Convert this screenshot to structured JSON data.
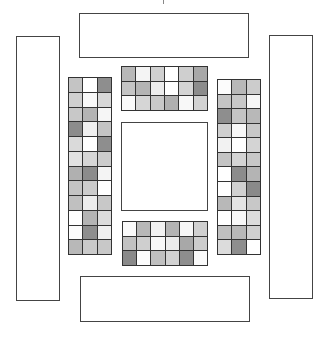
{
  "diagram": {
    "outer_boxes": [
      {
        "id": "top-box",
        "x": 79,
        "y": 13,
        "w": 170,
        "h": 45
      },
      {
        "id": "bottom-box",
        "x": 80,
        "y": 276,
        "w": 170,
        "h": 46
      },
      {
        "id": "left-box",
        "x": 16,
        "y": 36,
        "w": 44,
        "h": 265
      },
      {
        "id": "right-box",
        "x": 269,
        "y": 35,
        "w": 44,
        "h": 264
      }
    ],
    "center_box": {
      "id": "center-box",
      "x": 121,
      "y": 122,
      "w": 87,
      "h": 89
    },
    "grids": [
      {
        "id": "top-grid",
        "x": 121,
        "y": 66,
        "w": 87,
        "h": 45,
        "cols": 6,
        "rows": 3,
        "shades": [
          [
            "#b8b8b8",
            "#f4f4f4",
            "#d0d0d0",
            "#ffffff",
            "#cfcfcf",
            "#a8a8a8"
          ],
          [
            "#c4c4c4",
            "#b4b4b4",
            "#ececec",
            "#ffffff",
            "#d4d4d4",
            "#8c8c8c"
          ],
          [
            "#fafafa",
            "#d6d6d6",
            "#c8c8c8",
            "#b0b0b0",
            "#f8f8f8",
            "#d2d2d2"
          ]
        ]
      },
      {
        "id": "bottom-grid",
        "x": 122,
        "y": 221,
        "w": 86,
        "h": 45,
        "cols": 6,
        "rows": 3,
        "shades": [
          [
            "#fafafa",
            "#b8b8b8",
            "#f2f2f2",
            "#b4b4b4",
            "#f6f6f6",
            "#d0d0d0"
          ],
          [
            "#c2c2c2",
            "#cfcfcf",
            "#f8f8f8",
            "#ececec",
            "#a8a8a8",
            "#cccccc"
          ],
          [
            "#8a8a8a",
            "#fcfcfc",
            "#c0c0c0",
            "#d2d2d2",
            "#8e8e8e",
            "#fafafa"
          ]
        ]
      },
      {
        "id": "left-grid",
        "x": 68,
        "y": 77,
        "w": 44,
        "h": 178,
        "cols": 3,
        "rows": 12,
        "shades": [
          [
            "#c4c4c4",
            "#ffffff",
            "#8e8e8e"
          ],
          [
            "#d0d0d0",
            "#f8f8f8",
            "#d8d8d8"
          ],
          [
            "#c8c8c8",
            "#b4b4b4",
            "#f6f6f6"
          ],
          [
            "#8c8c8c",
            "#f0f0f0",
            "#c4c4c4"
          ],
          [
            "#dadada",
            "#ffffff",
            "#8e8e8e"
          ],
          [
            "#e2e2e2",
            "#d6d6d6",
            "#cccccc"
          ],
          [
            "#b0b0b0",
            "#8c8c8c",
            "#f4f4f4"
          ],
          [
            "#c4c4c4",
            "#cccccc",
            "#ffffff"
          ],
          [
            "#c0c0c0",
            "#ececec",
            "#c8c8c8"
          ],
          [
            "#ffffff",
            "#b4b4b4",
            "#dcdcdc"
          ],
          [
            "#fcfcfc",
            "#8e8e8e",
            "#f0f0f0"
          ],
          [
            "#b8b8b8",
            "#cacaca",
            "#c8c8c8"
          ]
        ]
      },
      {
        "id": "right-grid",
        "x": 217,
        "y": 79,
        "w": 44,
        "h": 176,
        "cols": 3,
        "rows": 12,
        "shades": [
          [
            "#fcfcfc",
            "#b8b8b8",
            "#cccccc"
          ],
          [
            "#c4c4c4",
            "#c8c8c8",
            "#f6f6f6"
          ],
          [
            "#8e8e8e",
            "#c4c4c4",
            "#b8b8b8"
          ],
          [
            "#d0d0d0",
            "#f8f8f8",
            "#c8c8c8"
          ],
          [
            "#f2f2f2",
            "#ffffff",
            "#d4d4d4"
          ],
          [
            "#c4c4c4",
            "#d4d4d4",
            "#c8c8c8"
          ],
          [
            "#ffffff",
            "#8c8c8c",
            "#b4b4b4"
          ],
          [
            "#ffffff",
            "#d0d0d0",
            "#8a8a8a"
          ],
          [
            "#b8b8b8",
            "#e4e4e4",
            "#c8c8c8"
          ],
          [
            "#ffffff",
            "#f8f8f8",
            "#dcdcdc"
          ],
          [
            "#c0c0c0",
            "#b8b8b8",
            "#d0d0d0"
          ],
          [
            "#dcdcdc",
            "#8e8e8e",
            "#ffffff"
          ]
        ]
      }
    ]
  }
}
